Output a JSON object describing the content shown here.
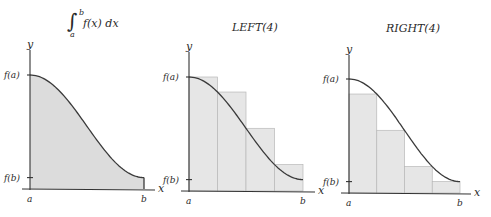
{
  "panels": [
    {
      "id": "integral",
      "title_parts": {
        "integral_sign": "∫",
        "upper": "b",
        "lower": "a",
        "integrand": "f(x) dx"
      },
      "mode": "area",
      "n": 0
    },
    {
      "id": "left",
      "title": "LEFT(4)",
      "mode": "left",
      "n": 4
    },
    {
      "id": "right",
      "title": "RIGHT(4)",
      "mode": "right",
      "n": 4
    }
  ],
  "labels": {
    "y_axis": "y",
    "x_axis": "x",
    "fa": "f(a)",
    "fb": "f(b)",
    "a": "a",
    "b": "b"
  },
  "function": {
    "description": "decreasing curve from f(a) to f(b), flat at a",
    "fa": 1.0,
    "fb": 0.1
  },
  "colors": {
    "area_fill": "#dcdcdc",
    "rect_fill": "#e6e6e6",
    "curve": "#3a3a3a"
  }
}
